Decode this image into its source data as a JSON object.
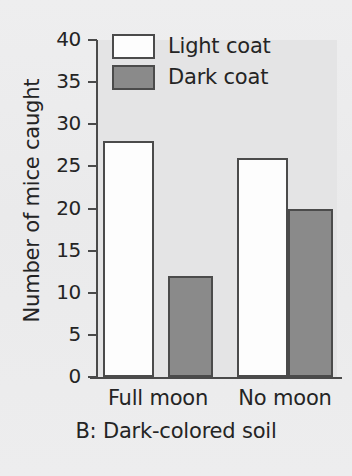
{
  "chart_data": {
    "type": "bar",
    "title": "",
    "caption": "B: Dark-colored soil",
    "xlabel": "",
    "ylabel": "Number of mice caught",
    "categories": [
      "Full moon",
      "No moon"
    ],
    "series": [
      {
        "name": "Light coat",
        "values": [
          28,
          26
        ],
        "color": "#fdfdfd"
      },
      {
        "name": "Dark coat",
        "values": [
          12,
          20
        ],
        "color": "#8a8a8a"
      }
    ],
    "ylim": [
      0,
      40
    ],
    "ytick_step": 5,
    "yticks": [
      0,
      5,
      10,
      15,
      20,
      25,
      30,
      35,
      40
    ],
    "ytick_labels": [
      "0",
      "5",
      "10",
      "15",
      "20",
      "25",
      "30",
      "35",
      "40"
    ],
    "grid": false,
    "legend_position": "top-left-inside",
    "bar_border_color": "#4b4b4b",
    "axis_color": "#4a4a4a",
    "plot_background": "#e4e4e5",
    "page_background": "#ececed"
  }
}
